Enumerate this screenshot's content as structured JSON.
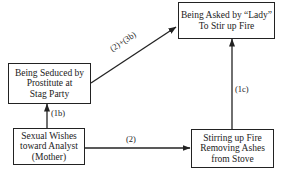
{
  "diagram": {
    "nodes": [
      {
        "id": "asked",
        "lines": [
          "Being Asked by “Lady”",
          "To Stir up Fire"
        ]
      },
      {
        "id": "seduced",
        "lines": [
          "Being Seduced by",
          "Prostitute at",
          "Stag Party"
        ]
      },
      {
        "id": "wishes",
        "lines": [
          "Sexual Wishes",
          "toward Analyst",
          "(Mother)"
        ]
      },
      {
        "id": "stirring",
        "lines": [
          "Stirring up Fire",
          "Removing  Ashes",
          "from Stove"
        ]
      }
    ],
    "edges": [
      {
        "from": "wishes",
        "to": "seduced",
        "label": "(1b)"
      },
      {
        "from": "wishes",
        "to": "stirring",
        "label": "(2)"
      },
      {
        "from": "stirring",
        "to": "asked",
        "label": "(1c)"
      },
      {
        "from": "seduced",
        "to": "asked",
        "label": "(2)+(3b)"
      }
    ],
    "colors": {
      "ink": "#222222",
      "background": "#ffffff"
    }
  }
}
